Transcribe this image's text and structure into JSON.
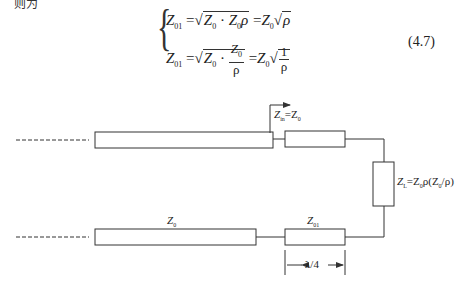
{
  "header_fragment": "则为",
  "equation": {
    "line1": {
      "lhs": "Z",
      "lhs_sub": "01",
      "middle": "= √(Z₀ · Z₀ρ)",
      "rhs": "= Z₀√ρ"
    },
    "line2": {
      "lhs": "Z",
      "lhs_sub": "01",
      "middle_prefix": "= √(Z₀ ·",
      "frac_num": "Z₀",
      "frac_den": "ρ",
      "rhs_prefix": "= Z₀",
      "rhs_frac_num": "1",
      "rhs_frac_den": "ρ"
    },
    "number": "(4.7)"
  },
  "diagram": {
    "labels": {
      "zin": "Z",
      "zin_sub": "in",
      "zin_rhs": "=Z",
      "zin_rhs_sub": "0",
      "load": "Z",
      "load_sub": "L",
      "load_rhs": "=Z",
      "load_rhs_sub": "0",
      "load_tail": "ρ(Z",
      "load_tail_sub": "0",
      "load_end": "/ρ)",
      "z0": "Z",
      "z0_sub": "0",
      "z01": "Z",
      "z01_sub": "01",
      "quarter_wave": "λ/4"
    },
    "stroke_color": "#333333"
  }
}
